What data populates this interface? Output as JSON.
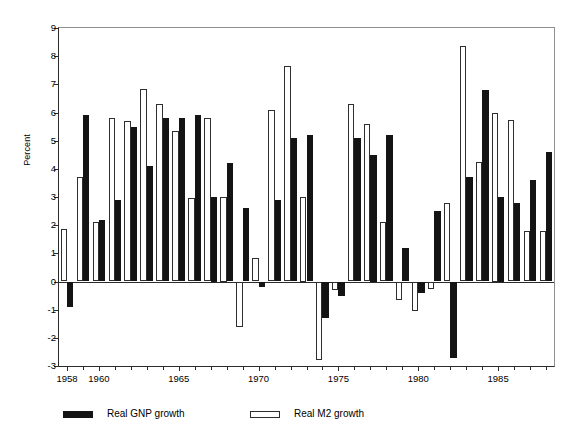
{
  "chart_data": {
    "type": "bar",
    "title": "",
    "subtitle": "",
    "xlabel": "",
    "ylabel": "Percent",
    "ylim": [
      -3,
      9
    ],
    "ytick_labels": [
      "9",
      "8",
      "7",
      "6",
      "5",
      "4",
      "3",
      "2",
      "1",
      "0",
      "-1",
      "-2",
      "-3"
    ],
    "ytick_values": [
      9,
      8,
      7,
      6,
      5,
      4,
      3,
      2,
      1,
      0,
      -1,
      -2,
      -3
    ],
    "xlim": [
      1957.5,
      1988.5
    ],
    "categories": [
      "1958",
      "1959",
      "1960",
      "1961",
      "1962",
      "1963",
      "1964",
      "1965",
      "1966",
      "1967",
      "1968",
      "1969",
      "1970",
      "1971",
      "1972",
      "1973",
      "1974",
      "1975",
      "1976",
      "1977",
      "1978",
      "1979",
      "1980",
      "1981",
      "1982",
      "1983",
      "1984",
      "1985",
      "1986",
      "1987",
      "1988"
    ],
    "xtick_labels": [
      "1958",
      "1960",
      "1965",
      "1970",
      "1975",
      "1980",
      "1985"
    ],
    "xtick_label_values": [
      1958,
      1960,
      1965,
      1970,
      1975,
      1980,
      1985
    ],
    "grid": false,
    "legend_position": "bottom",
    "series": [
      {
        "name": "Real GNP growth",
        "color": "#141414",
        "fill": "solid",
        "values": [
          -0.9,
          5.9,
          2.2,
          2.9,
          5.5,
          4.1,
          5.8,
          5.8,
          5.9,
          3.0,
          4.2,
          2.6,
          -0.2,
          2.9,
          5.1,
          5.2,
          -1.3,
          -0.5,
          5.1,
          4.5,
          5.2,
          1.2,
          -0.4,
          2.5,
          -2.7,
          3.7,
          6.8,
          3.0,
          2.8,
          3.6,
          4.6
        ]
      },
      {
        "name": "Real M2 growth",
        "color": "#ffffff",
        "fill": "hollow",
        "values": [
          1.85,
          3.7,
          2.1,
          5.8,
          5.7,
          6.85,
          6.3,
          5.35,
          2.95,
          5.8,
          3.0,
          -1.6,
          0.85,
          6.1,
          7.65,
          3.0,
          -2.8,
          -0.3,
          6.3,
          5.6,
          2.1,
          -0.65,
          -1.05,
          -0.25,
          2.8,
          8.35,
          4.25,
          6.0,
          5.75,
          1.8,
          1.8
        ]
      }
    ]
  },
  "legend": {
    "entries": [
      {
        "label": "Real GNP growth",
        "style": "gnp"
      },
      {
        "label": "Real M2 growth",
        "style": "m2"
      }
    ]
  }
}
